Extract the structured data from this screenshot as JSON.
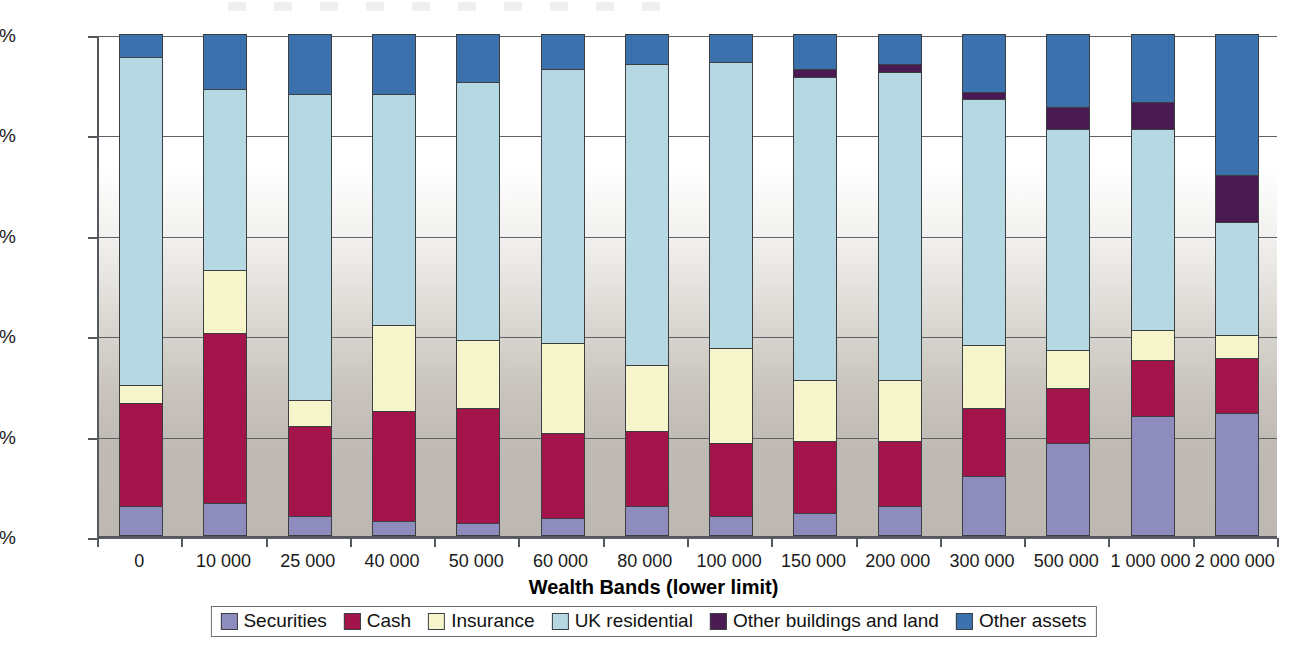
{
  "chart_data": {
    "type": "bar",
    "stacked": true,
    "normalized_percent": true,
    "title": "",
    "xlabel": "Wealth Bands (lower limit)",
    "ylabel": "",
    "ylim": [
      0,
      100
    ],
    "ytick_labels": [
      "0%",
      "20%",
      "40%",
      "60%",
      "80%",
      "100%"
    ],
    "ytick_values": [
      0,
      20,
      40,
      60,
      80,
      100
    ],
    "grid": true,
    "legend_position": "bottom",
    "categories": [
      "0",
      "10 000",
      "25 000",
      "40 000",
      "50 000",
      "60 000",
      "80 000",
      "100 000",
      "150 000",
      "200 000",
      "300 000",
      "500 000",
      "1 000 000",
      "2 000 000"
    ],
    "series": [
      {
        "name": "Securities",
        "color": "#8d8cbd",
        "values": [
          6.0,
          6.5,
          4.0,
          3.0,
          2.5,
          3.5,
          6.0,
          4.0,
          4.5,
          6.0,
          12.0,
          18.5,
          24.0,
          24.5
        ]
      },
      {
        "name": "Cash",
        "color": "#a3154a",
        "values": [
          20.5,
          34.0,
          18.0,
          22.0,
          23.0,
          17.0,
          15.0,
          14.5,
          14.5,
          13.0,
          13.5,
          11.0,
          11.0,
          11.0
        ]
      },
      {
        "name": "Insurance",
        "color": "#f7f5cc",
        "values": [
          3.5,
          12.5,
          5.0,
          17.0,
          13.5,
          18.0,
          13.0,
          19.0,
          12.0,
          12.0,
          12.5,
          7.5,
          6.0,
          4.5
        ]
      },
      {
        "name": "UK residential",
        "color": "#b6d8e2",
        "values": [
          65.5,
          36.0,
          61.0,
          46.0,
          51.5,
          54.5,
          60.0,
          57.0,
          60.5,
          61.5,
          49.0,
          44.0,
          40.0,
          22.5
        ]
      },
      {
        "name": "Other buildings and land",
        "color": "#4a1a52",
        "values": [
          0,
          0,
          0,
          0,
          0,
          0,
          0,
          0,
          1.5,
          1.5,
          1.5,
          4.5,
          5.5,
          9.5
        ]
      },
      {
        "name": "Other assets",
        "color": "#3b71ad",
        "values": [
          4.5,
          11.0,
          12.0,
          12.0,
          9.5,
          7.0,
          6.0,
          5.5,
          7.0,
          6.0,
          11.5,
          14.5,
          13.5,
          28.0
        ]
      }
    ]
  },
  "axes": {
    "x_title": "Wealth Bands (lower limit)"
  }
}
